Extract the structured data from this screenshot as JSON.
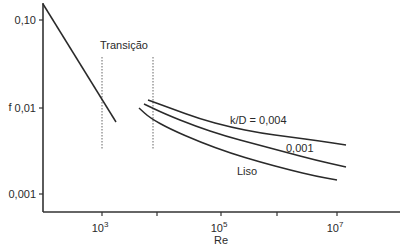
{
  "chart_data": {
    "type": "line",
    "title": "",
    "xlabel": "Re",
    "ylabel": "f",
    "xscale": "log",
    "yscale": "log",
    "xlim": [
      100,
      100000000
    ],
    "ylim": [
      0.0006,
      0.15
    ],
    "grid": false,
    "x_ticks": [
      {
        "base": "10",
        "exp": "3",
        "value": 1000,
        "px": 102
      },
      {
        "base": "",
        "exp": "",
        "value": 10000,
        "px": 157
      },
      {
        "base": "10",
        "exp": "5",
        "value": 100000,
        "px": 221
      },
      {
        "base": "",
        "exp": "",
        "value": 1000000,
        "px": 277
      },
      {
        "base": "10",
        "exp": "7",
        "value": 10000000,
        "px": 337
      }
    ],
    "y_ticks": [
      {
        "label": "0,10",
        "value": 0.1,
        "py": 20
      },
      {
        "label": "0,01",
        "value": 0.01,
        "py": 108
      },
      {
        "label": "0,001",
        "value": 0.001,
        "py": 194
      }
    ],
    "annotations": [
      {
        "text": "Transição",
        "x": 100,
        "y": 49
      },
      {
        "text": "k/D = 0,004",
        "x": 230,
        "y": 124
      },
      {
        "text": "0,001",
        "x": 286,
        "y": 152
      },
      {
        "text": "Liso",
        "x": 237,
        "y": 175
      }
    ],
    "transition_bounds": [
      {
        "value": 1000,
        "px": 102
      },
      {
        "value": 7000,
        "px": 153
      }
    ],
    "series": [
      {
        "name": "Laminar",
        "points_re_f": [
          [
            100,
            0.14
          ],
          [
            1800,
            0.008
          ]
        ],
        "pixels": [
          [
            43,
            4
          ],
          [
            116,
            122
          ]
        ]
      },
      {
        "name": "k/D = 0,004",
        "points_re_f": [
          [
            7000,
            0.011
          ],
          [
            100000,
            0.0055
          ],
          [
            10000000,
            0.0035
          ]
        ],
        "pixels": [
          [
            148,
            100
          ],
          [
            170,
            108
          ],
          [
            200,
            119
          ],
          [
            230,
            127
          ],
          [
            260,
            133
          ],
          [
            290,
            137
          ],
          [
            320,
            141
          ],
          [
            346,
            145
          ]
        ]
      },
      {
        "name": "k/D = 0,001",
        "points_re_f": [
          [
            6000,
            0.01
          ],
          [
            100000,
            0.0045
          ],
          [
            10000000,
            0.0025
          ]
        ],
        "pixels": [
          [
            144,
            104
          ],
          [
            165,
            114
          ],
          [
            195,
            126
          ],
          [
            225,
            136
          ],
          [
            255,
            144
          ],
          [
            285,
            152
          ],
          [
            315,
            160
          ],
          [
            346,
            167
          ]
        ]
      },
      {
        "name": "Liso",
        "points_re_f": [
          [
            5000,
            0.009
          ],
          [
            100000,
            0.0035
          ],
          [
            10000000,
            0.002
          ]
        ],
        "pixels": [
          [
            139,
            108
          ],
          [
            150,
            118
          ],
          [
            170,
            129
          ],
          [
            200,
            142
          ],
          [
            230,
            153
          ],
          [
            260,
            162
          ],
          [
            290,
            170
          ],
          [
            315,
            176
          ],
          [
            337,
            180
          ]
        ]
      }
    ]
  }
}
